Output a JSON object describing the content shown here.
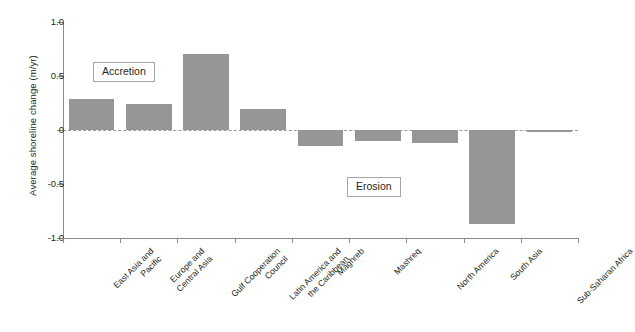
{
  "chart_data": {
    "type": "bar",
    "title": "",
    "subtitle": "",
    "xlabel": "",
    "ylabel": "Average shoreline change (m/yr)",
    "ylim": [
      -1.0,
      1.0
    ],
    "ytick_labels": [
      "1.0",
      "0.5",
      "0",
      "-0.5",
      "-1.0"
    ],
    "ytick_values": [
      1.0,
      0.5,
      0,
      -0.5,
      -1.0
    ],
    "grid": false,
    "legend": "none",
    "zero_line": true,
    "bar_color": "#969696",
    "categories": [
      "East Asia and Pacific",
      "Europe and Central Asia",
      "Gulf Cooperation Council",
      "Latin America and the Caribbean",
      "Maghreb",
      "Mashreq",
      "North America",
      "South Asia",
      "Sub-Saharan Africa"
    ],
    "category_lines": [
      [
        "East Asia and",
        "Pacific"
      ],
      [
        "Europe and",
        "Central Asia"
      ],
      [
        "Gulf Cooperation",
        "Council"
      ],
      [
        "Latin America and",
        "the Caribbean"
      ],
      [
        "Maghreb"
      ],
      [
        "Mashreq"
      ],
      [
        "North America"
      ],
      [
        "South Asia"
      ],
      [
        "Sub-Saharan Africa"
      ]
    ],
    "values": [
      0.29,
      0.24,
      0.7,
      0.19,
      -0.15,
      -0.1,
      -0.12,
      -0.87,
      -0.02
    ],
    "annotations": [
      {
        "text": "Accretion",
        "region": "positive"
      },
      {
        "text": "Erosion",
        "region": "negative"
      }
    ]
  }
}
